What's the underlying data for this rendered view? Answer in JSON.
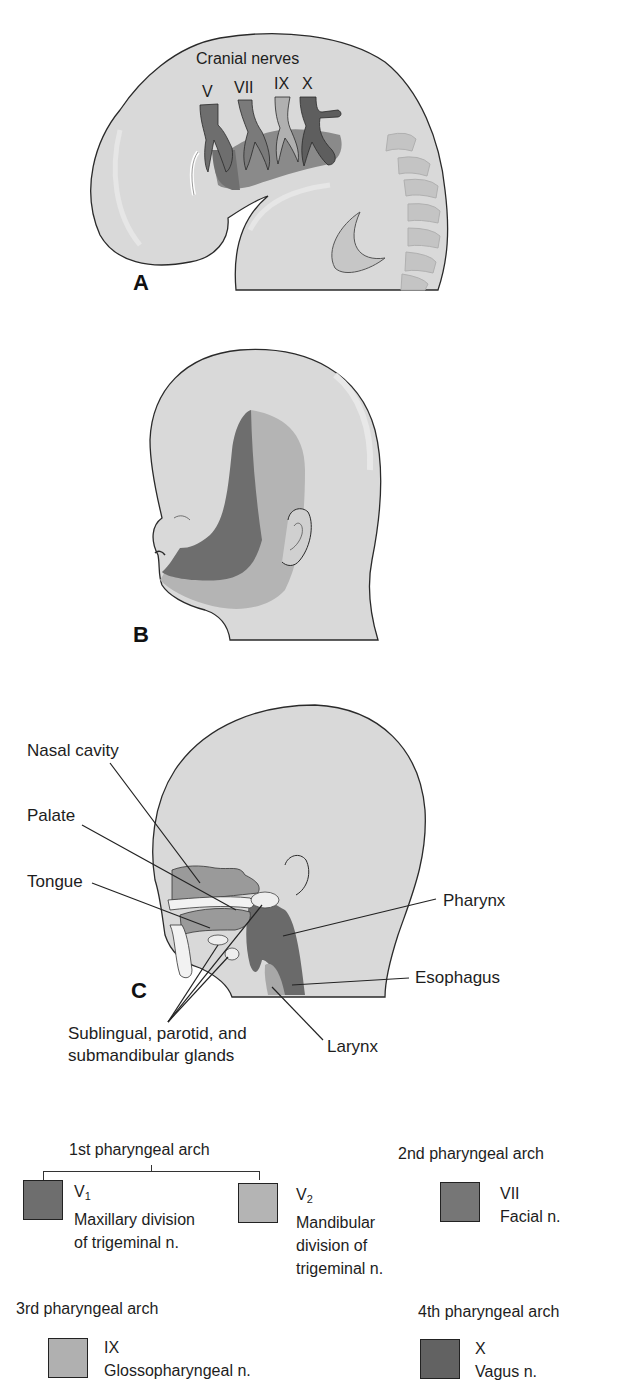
{
  "panels": {
    "A": {
      "letter": "A",
      "title": "Cranial nerves",
      "nerves": [
        "V",
        "VII",
        "IX",
        "X"
      ]
    },
    "B": {
      "letter": "B"
    },
    "C": {
      "letter": "C",
      "labels": {
        "nasal_cavity": "Nasal cavity",
        "palate": "Palate",
        "tongue": "Tongue",
        "pharynx": "Pharynx",
        "esophagus": "Esophagus",
        "larynx": "Larynx",
        "glands_line1": "Sublingual, parotid, and",
        "glands_line2": "submandibular glands"
      }
    }
  },
  "legend": {
    "arch1": {
      "title": "1st pharyngeal arch",
      "v1": {
        "code": "V",
        "sub": "1",
        "line1": "Maxillary division",
        "line2": "of trigeminal n.",
        "color": "#6e6e6e"
      },
      "v2": {
        "code": "V",
        "sub": "2",
        "line1": "Mandibular",
        "line2": "division of",
        "line3": "trigeminal n.",
        "color": "#b4b4b4"
      }
    },
    "arch2": {
      "title": "2nd pharyngeal arch",
      "code": "VII",
      "name": "Facial n.",
      "color": "#767676"
    },
    "arch3": {
      "title": "3rd pharyngeal arch",
      "code": "IX",
      "name": "Glossopharyngeal n.",
      "color": "#b0b0b0"
    },
    "arch4": {
      "title": "4th pharyngeal arch",
      "code": "X",
      "name": "Vagus n.",
      "color": "#626262"
    }
  },
  "colors": {
    "skin": "#d9d9d9",
    "outline": "#2a2a2a",
    "dark_region": "#6e6e6e",
    "mid_region": "#a9a9a9",
    "light_region": "#bdbdbd"
  }
}
